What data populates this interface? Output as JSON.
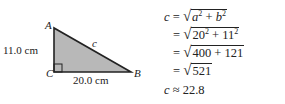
{
  "figure": {
    "vertices": {
      "A": "A",
      "B": "B",
      "C": "C"
    },
    "hypotenuse_label": "c",
    "vertical_side_label": "11.0 cm",
    "horizontal_side_label": "20.0 cm",
    "fill_color": "#b8b8b8",
    "stroke_color": "#222222"
  },
  "math": {
    "line1": {
      "lhs": "c",
      "eq": "=",
      "radicand_a": "a",
      "exp_a": "2",
      "plus": "+",
      "radicand_b": "b",
      "exp_b": "2"
    },
    "line2": {
      "eq": "=",
      "n1": "20",
      "exp1": "2",
      "plus": "+",
      "n2": "11",
      "exp2": "2"
    },
    "line3": {
      "eq": "=",
      "radicand": "400 + 121"
    },
    "line4": {
      "eq": "=",
      "radicand": "521"
    },
    "line5": {
      "lhs": "c",
      "approx": "≈",
      "value": "22.8"
    }
  }
}
